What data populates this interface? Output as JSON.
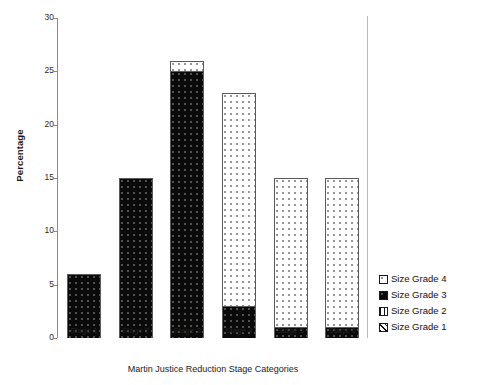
{
  "chart_data": {
    "type": "bar",
    "subtype": "stacked-bar",
    "title": "",
    "xlabel": "Martin Justice Reduction Stage Categories",
    "ylabel": "Percentage",
    "categories": [
      "Stage 1",
      "Stage 2",
      "Stage 3",
      "Stage 4",
      "Stage 5",
      "Stage 6"
    ],
    "ylim": [
      0,
      30
    ],
    "yticks": [
      0,
      5,
      10,
      15,
      20,
      25,
      30
    ],
    "ytick_labels": [
      "0",
      "5",
      "10",
      "15",
      "20",
      "25",
      "30"
    ],
    "grid": false,
    "legend_position": "right-bottom",
    "series": [
      {
        "name": "Size Grade 3",
        "pattern": "solid-black",
        "values": [
          6,
          15,
          25,
          3,
          1,
          1
        ]
      },
      {
        "name": "Size Grade 4",
        "pattern": "open-white",
        "values": [
          0,
          0,
          1,
          20,
          14,
          14
        ]
      }
    ],
    "totals": [
      6,
      15,
      26,
      23,
      15,
      15
    ],
    "legend_entries": [
      {
        "label": "Size Grade 4",
        "pattern": "open-white"
      },
      {
        "label": "Size Grade 3",
        "pattern": "solid-black"
      },
      {
        "label": "Size Grade 2",
        "pattern": "vertical-lines"
      },
      {
        "label": "Size Grade 1",
        "pattern": "diagonal-hatch"
      }
    ]
  }
}
